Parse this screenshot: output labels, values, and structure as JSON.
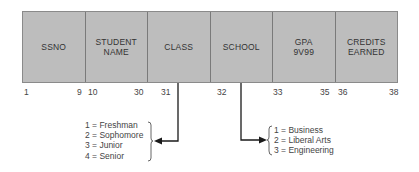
{
  "record": {
    "fields": [
      {
        "label": "SSNO",
        "start": "1",
        "end": "9"
      },
      {
        "label": "STUDENT\nNAME",
        "start": "10",
        "end": "30"
      },
      {
        "label": "CLASS",
        "start": "31",
        "end": ""
      },
      {
        "label": "SCHOOL",
        "start": "32",
        "end": ""
      },
      {
        "label": "GPA\n9V99",
        "start": "33",
        "end": "35"
      },
      {
        "label": "CREDITS\nEARNED",
        "start": "36",
        "end": "38"
      }
    ]
  },
  "class_codes": {
    "items": [
      "1 = Freshman",
      "2 = Sophomore",
      "3 = Junior",
      "4 = Senior"
    ]
  },
  "school_codes": {
    "items": [
      "1 = Business",
      "2 = Liberal Arts",
      "3 = Engineering"
    ]
  },
  "colors": {
    "cell_fill": "#bdbdbd",
    "line": "#1a1a1a"
  }
}
